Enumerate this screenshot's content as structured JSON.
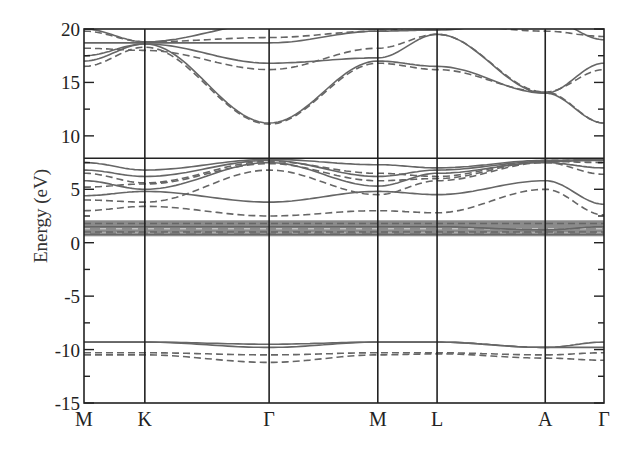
{
  "chart_data": {
    "type": "line",
    "title": "",
    "xlabel": "",
    "ylabel": "Energy (eV)",
    "ylim": [
      -15,
      20
    ],
    "yticks": [
      -15,
      -10,
      -5,
      0,
      5,
      10,
      15,
      20
    ],
    "ytick_labels": [
      "-15",
      "-10",
      "-5",
      "0",
      "5",
      "10",
      "15",
      "20"
    ],
    "kpath_labels": [
      "M",
      "K",
      "Γ",
      "M",
      "L",
      "A",
      "Γ"
    ],
    "kpath_positions": [
      0,
      0.117,
      0.356,
      0.565,
      0.679,
      0.887,
      1.0
    ],
    "grid": false,
    "legend": null,
    "reference_line": {
      "y": 7.9,
      "style": "solid",
      "description": "horizontal line marking top of valence band"
    },
    "series": [
      {
        "name": "band set 1 (solid)",
        "style": "solid",
        "description": "Solid-line band structure",
        "bands_at_kpoints": {
          "M": [
            -9.3,
            0.8,
            1.5,
            4.5,
            5.8,
            7.5,
            17.0,
            17.5,
            18.7,
            20.0
          ],
          "K": [
            -9.3,
            0.8,
            1.5,
            4.8,
            6.0,
            6.8,
            18.6,
            18.6,
            18.7,
            18.7
          ],
          "Γ": [
            -9.8,
            0.8,
            1.5,
            3.8,
            7.5,
            7.8,
            11.2,
            16.8,
            18.7,
            20.0
          ],
          "M2": [
            -9.3,
            0.8,
            1.5,
            4.8,
            5.5,
            7.2,
            16.8,
            17.2,
            19.5,
            20.0
          ],
          "L": [
            -9.3,
            0.8,
            1.5,
            4.5,
            6.5,
            7.0,
            16.5,
            19.5,
            20.0
          ],
          "A": [
            -9.8,
            0.8,
            1.5,
            5.8,
            7.5,
            14.0,
            20.0
          ],
          "Γ2": [
            -9.3,
            -9.8,
            0.8,
            1.5,
            3.5,
            7.0,
            7.8,
            11.2,
            16.8,
            19.0
          ]
        }
      },
      {
        "name": "band set 2 (dashed)",
        "style": "dashed",
        "description": "Dashed-line band structure",
        "bands_at_kpoints": {
          "M": [
            -10.3,
            -10.5,
            1.0,
            1.8,
            3.0,
            4.0,
            6.5,
            16.5,
            18.2,
            19.8
          ],
          "K": [
            -10.3,
            -10.5,
            1.0,
            1.8,
            3.4,
            3.8,
            5.5,
            18.0,
            18.3,
            18.8
          ],
          "Γ": [
            -10.5,
            -11.2,
            1.0,
            1.8,
            2.5,
            6.8,
            7.5,
            11.1,
            16.2,
            19.2
          ],
          "M2": [
            -10.3,
            -10.5,
            1.0,
            1.8,
            3.0,
            4.5,
            5.8,
            16.5,
            18.2,
            19.8
          ],
          "L": [
            -10.3,
            1.0,
            1.8,
            2.8,
            6.0,
            16.2,
            19.5
          ],
          "A": [
            -10.5,
            -10.8,
            1.0,
            1.8,
            5.0,
            7.5,
            14.1,
            19.8
          ],
          "Γ2": [
            -10.3,
            -11.0,
            1.0,
            1.8,
            2.6,
            6.5,
            7.6,
            11.2,
            16.2,
            19.3
          ]
        }
      }
    ]
  }
}
